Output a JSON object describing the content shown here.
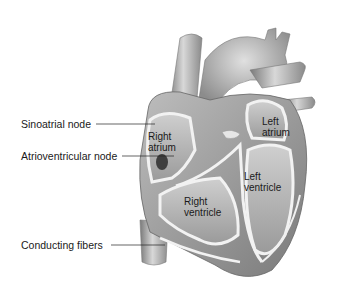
{
  "diagram": {
    "external_labels": [
      {
        "id": "sinoatrial",
        "text": "Sinoatrial node"
      },
      {
        "id": "atrioventricular",
        "text": "Atrioventricular node"
      },
      {
        "id": "conducting",
        "text": "Conducting fibers"
      }
    ],
    "chamber_labels": {
      "right_atrium": {
        "line1": "Right",
        "line2": "atrium"
      },
      "left_atrium": {
        "line1": "Left",
        "line2": "atrium"
      },
      "left_ventricle": {
        "line1": "Left",
        "line2": "ventricle"
      },
      "right_ventricle": {
        "line1": "Right",
        "line2": "ventricle"
      }
    },
    "colors": {
      "background": "#ffffff",
      "tissue_light": "#d9d9d9",
      "tissue_mid": "#a8a8a8",
      "tissue_dark": "#6e6e6e",
      "wall_highlight": "#f2f2f2",
      "text": "#1a1a1a"
    }
  }
}
